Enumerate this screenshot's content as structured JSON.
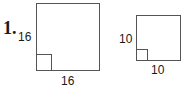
{
  "problem": {
    "number": "1.",
    "figures": [
      {
        "shape": "square",
        "side_label": "16",
        "bottom_label": "16",
        "right_angle_marker": true
      },
      {
        "shape": "square",
        "side_label": "10",
        "bottom_label": "10",
        "right_angle_marker": true
      }
    ]
  }
}
